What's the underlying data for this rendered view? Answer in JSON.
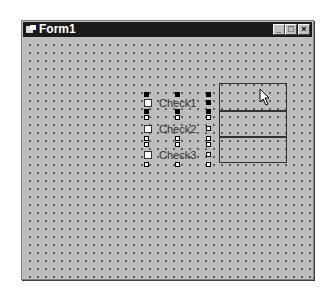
{
  "window": {
    "title": "Form1",
    "buttons": {
      "minimize": "_",
      "maximize": "□",
      "close": "×"
    }
  },
  "checkboxes": [
    {
      "label": "Check1",
      "selected": true
    },
    {
      "label": "Check2",
      "selected": false
    },
    {
      "label": "Check3",
      "selected": false
    }
  ],
  "frame": {
    "sections": 3
  },
  "colors": {
    "titlebar": "#1a1a1a",
    "client": "#bdbdbd"
  }
}
